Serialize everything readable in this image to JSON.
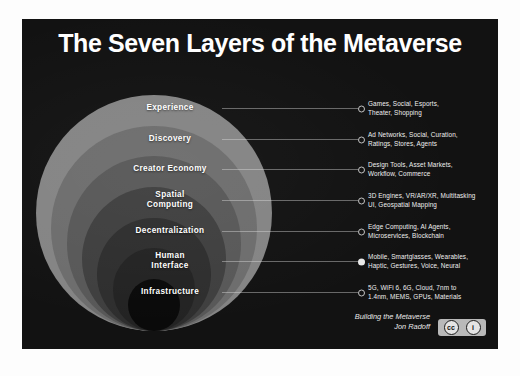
{
  "poster": {
    "title": "The Seven Layers of the Metaverse",
    "background_color": "#121212",
    "title_color": "#ffffff"
  },
  "layers": [
    {
      "name": "Experience",
      "description": "Games, Social, Esports,\nTheater, Shopping",
      "ring_color": "#848484",
      "marker": "hollow"
    },
    {
      "name": "Discovery",
      "description": "Ad Networks, Social, Curation,\nRatings, Stores, Agents",
      "ring_color": "#6d6d6d",
      "marker": "hollow"
    },
    {
      "name": "Creator Economy",
      "description": "Design Tools, Asset Markets,\nWorkflow, Commerce",
      "ring_color": "#585858",
      "marker": "hollow"
    },
    {
      "name": "Spatial\nComputing",
      "description": "3D Engines, VR/AR/XR, Multitasking\nUI, Geospatial Mapping",
      "ring_color": "#3f3f3f",
      "marker": "hollow"
    },
    {
      "name": "Decentralization",
      "description": "Edge Computing, AI Agents,\nMicroservices, Blockchain",
      "ring_color": "#2e2e2e",
      "marker": "hollow"
    },
    {
      "name": "Human\nInterface",
      "description": "Mobile, Smartglasses, Wearables,\nHaptic, Gestures, Voice, Neural",
      "ring_color": "#232323",
      "marker": "filled"
    },
    {
      "name": "Infrastructure",
      "description": "5G, WiFi 6, 6G, Cloud, 7nm to\n1.4nm, MEMS, GPUs, Materials",
      "ring_color": "#0a0a0a",
      "marker": "hollow"
    }
  ],
  "credit": {
    "line1": "Building the Metaverse",
    "line2": "Jon Radoff"
  },
  "license": {
    "badge_label_1": "cc",
    "badge_label_2": "i",
    "badge_color": "#b9b9b9"
  }
}
